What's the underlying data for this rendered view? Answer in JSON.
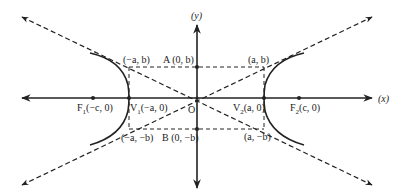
{
  "diagram": {
    "colors": {
      "ink": "#222222",
      "background": "#ffffff"
    },
    "axes": {
      "x_label": "(x)",
      "y_label": "(y)"
    },
    "origin": {
      "label": "O"
    },
    "points": {
      "F1": {
        "letter": "F",
        "sub": "1",
        "coords": "(−c, 0)"
      },
      "V1": {
        "letter": "V",
        "sub": "1",
        "coords": "(−a, 0)"
      },
      "V2": {
        "letter": "V",
        "sub": "2",
        "coords": "(a, 0)"
      },
      "F2": {
        "letter": "F",
        "sub": "2",
        "coords": "(c, 0)"
      },
      "A": {
        "label": "A (0, b)"
      },
      "B": {
        "label": "B (0, −b)"
      }
    },
    "corners": {
      "top_left": "(−a, b)",
      "top_right": "(a, b)",
      "bottom_left": "(−a, −b)",
      "bottom_right": "(a, −b)"
    },
    "elements": {
      "hyperbola_branches": 2,
      "asymptotes": 2,
      "auxiliary_rectangle": "dashed, vertices (±a, ±b)"
    }
  }
}
